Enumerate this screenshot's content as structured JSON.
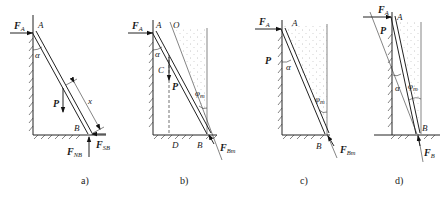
{
  "figure": {
    "panels": [
      {
        "id": "a",
        "caption": "a)",
        "labels": {
          "top_point": "A",
          "bottom_point": "B",
          "angle": "α",
          "force_A": "F",
          "force_A_sub": "A",
          "weight": "P",
          "normal_B": "F",
          "normal_B_sub": "NB",
          "friction_B": "F",
          "friction_B_sub": "SB",
          "distance": "x"
        }
      },
      {
        "id": "b",
        "caption": "b)",
        "labels": {
          "top_point": "A",
          "intersection": "O",
          "center": "C",
          "foot": "D",
          "bottom_point": "B",
          "angle": "α",
          "friction_angle": "φ",
          "friction_angle_sub": "m",
          "force_A": "F",
          "force_A_sub": "A",
          "weight": "P",
          "force_B": "F",
          "force_B_sub": "Bm"
        }
      },
      {
        "id": "c",
        "caption": "c)",
        "labels": {
          "top_point": "A",
          "bottom_point": "B",
          "angle": "α",
          "friction_angle": "φ",
          "friction_angle_sub": "m",
          "force_A": "F",
          "force_A_sub": "A",
          "weight": "P",
          "force_B": "F",
          "force_B_sub": "Bm"
        }
      },
      {
        "id": "d",
        "caption": "d)",
        "labels": {
          "top_point": "A",
          "bottom_point": "B",
          "angle": "α",
          "friction_angle": "φ",
          "friction_angle_sub": "m",
          "force_A": "F",
          "force_A_sub": "A",
          "weight": "P",
          "force_B": "F",
          "force_B_sub": "B"
        }
      }
    ]
  }
}
